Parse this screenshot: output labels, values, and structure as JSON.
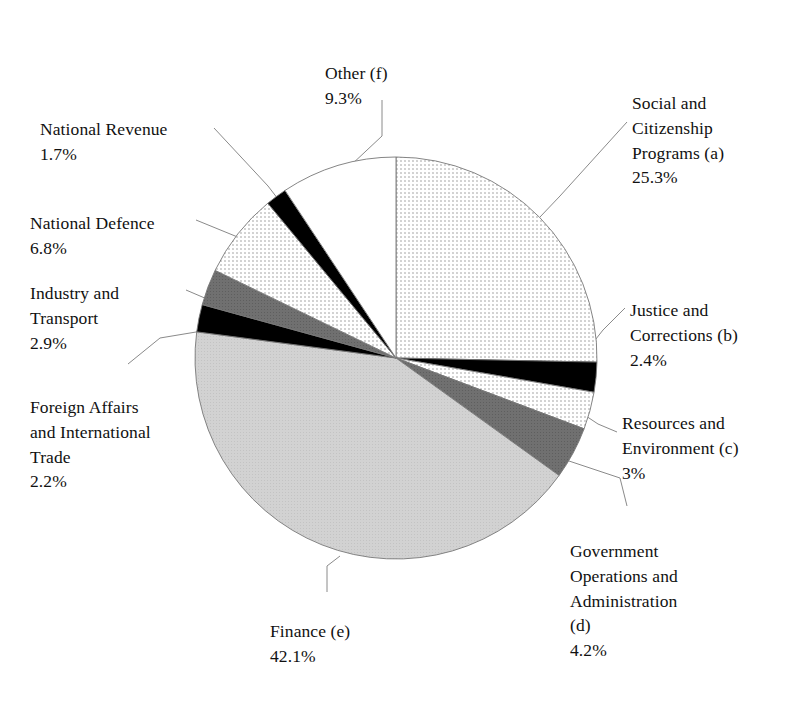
{
  "chart_data": {
    "type": "pie",
    "title": "",
    "subtitle": "",
    "xlabel": "",
    "ylabel": "",
    "legend_position": "none",
    "grid": false,
    "units": "percent",
    "start_angle_deg": 0,
    "direction": "clockwise",
    "categories": [
      "Social and Citizenship Programs (a)",
      "Justice and Corrections (b)",
      "Resources and Environment (c)",
      "Government Operations and Administration (d)",
      "Finance (e)",
      "Foreign Affairs and International Trade",
      "Industry and Transport",
      "National Defence",
      "National Revenue",
      "Other (f)"
    ],
    "values": [
      25.3,
      2.4,
      3.0,
      4.2,
      42.1,
      2.2,
      2.9,
      6.8,
      1.7,
      9.3
    ],
    "value_labels": [
      "25.3%",
      "2.4%",
      "3%",
      "4.2%",
      "42.1%",
      "2.2%",
      "2.9%",
      "6.8%",
      "1.7%",
      "9.3%"
    ],
    "slice_fills": [
      "light-dot",
      "black",
      "light-dot",
      "dark-gray",
      "light-gray",
      "black",
      "dark-gray",
      "light-dot",
      "black",
      "white"
    ]
  },
  "slices": [
    {
      "key": "social",
      "name": "Social and Citizenship Programs (a)",
      "label_lines": "Social and\nCitizenship\nPrograms (a)",
      "percent_label": "25.3%",
      "value": 25.3,
      "fill": "light-dot"
    },
    {
      "key": "justice",
      "name": "Justice and Corrections (b)",
      "label_lines": "Justice and\nCorrections (b)",
      "percent_label": "2.4%",
      "value": 2.4,
      "fill": "black"
    },
    {
      "key": "resources",
      "name": "Resources and Environment (c)",
      "label_lines": "Resources and\nEnvironment (c)",
      "percent_label": "3%",
      "value": 3.0,
      "fill": "light-dot"
    },
    {
      "key": "govops",
      "name": "Government Operations and Administration (d)",
      "label_lines": "Government\nOperations and\nAdministration\n(d)",
      "percent_label": "4.2%",
      "value": 4.2,
      "fill": "dark-gray"
    },
    {
      "key": "finance",
      "name": "Finance (e)",
      "label_lines": "Finance (e)",
      "percent_label": "42.1%",
      "value": 42.1,
      "fill": "light-gray"
    },
    {
      "key": "foreign",
      "name": "Foreign Affairs and International Trade",
      "label_lines": "Foreign Affairs\nand International\nTrade",
      "percent_label": "2.2%",
      "value": 2.2,
      "fill": "black"
    },
    {
      "key": "industry",
      "name": "Industry and Transport",
      "label_lines": "Industry and\nTransport",
      "percent_label": "2.9%",
      "value": 2.9,
      "fill": "dark-gray"
    },
    {
      "key": "defence",
      "name": "National Defence",
      "label_lines": "National Defence",
      "percent_label": "6.8%",
      "value": 6.8,
      "fill": "light-dot"
    },
    {
      "key": "revenue",
      "name": "National Revenue",
      "label_lines": "National Revenue",
      "percent_label": "1.7%",
      "value": 1.7,
      "fill": "black"
    },
    {
      "key": "other",
      "name": "Other (f)",
      "label_lines": "Other (f)",
      "percent_label": "9.3%",
      "value": 9.3,
      "fill": "white"
    }
  ],
  "colors": {
    "black": "#000000",
    "dark_gray": "#6e6e6e",
    "light_gray": "#cfcfcf",
    "light_dot_bg": "#ffffff",
    "light_dot_ink": "#9a9a9a",
    "outline": "#777777",
    "leader_line": "#8a8a8a",
    "text": "#111111"
  }
}
